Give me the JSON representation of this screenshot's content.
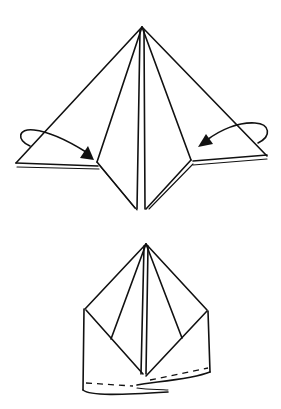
{
  "figure": {
    "type": "origami-fold-diagram",
    "steps": [
      {
        "name": "step-fold-sides-in",
        "description": "Pyramid shape with two outer flaps; curved arrows indicate folding left and right flaps inward"
      },
      {
        "name": "step-result",
        "description": "Folded result with dashed fold line along bottom edge"
      }
    ],
    "colors": {
      "line": "#111111",
      "background": "#ffffff"
    }
  }
}
